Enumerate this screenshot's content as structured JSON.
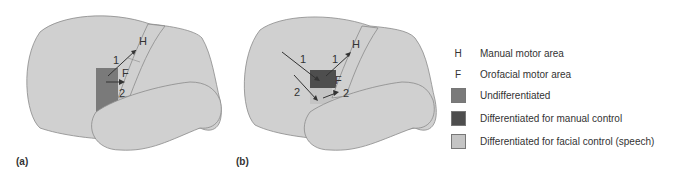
{
  "panels": [
    {
      "id": "a",
      "label": "(a)",
      "area_labels": {
        "H": "H",
        "F": "F"
      },
      "pathway_labels": [
        "1",
        "2"
      ]
    },
    {
      "id": "b",
      "label": "(b)",
      "area_labels": {
        "H": "H",
        "F": "F"
      },
      "pathway_labels": [
        "1",
        "2",
        "1",
        "2"
      ]
    }
  ],
  "legend": {
    "items": [
      {
        "key": "H",
        "label": "Manual motor area"
      },
      {
        "key": "F",
        "label": "Orofacial motor area"
      },
      {
        "swatch": "#7a7a7a",
        "label": "Undifferentiated"
      },
      {
        "swatch": "#4e4e4e",
        "label": "Differentiated for manual control"
      },
      {
        "swatch": "#c4c4c4",
        "label": "Differentiated for facial control (speech)"
      }
    ]
  },
  "colors": {
    "brain_fill": "#d0d0d0",
    "brain_stroke": "#8a8a8a",
    "undifferentiated": "#7a7a7a",
    "manual": "#4e4e4e",
    "facial": "#c4c4c4"
  }
}
